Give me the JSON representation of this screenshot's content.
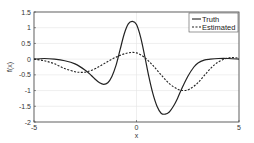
{
  "chart_data": {
    "type": "line",
    "title": "",
    "xlabel": "x",
    "ylabel": "f(x)",
    "xlim": [
      -5,
      5
    ],
    "ylim": [
      -2,
      1.5
    ],
    "xticks": [
      -5,
      0,
      5
    ],
    "xtick_labels": [
      "-5",
      "0",
      "5"
    ],
    "yticks": [
      -2,
      -1.5,
      -1,
      -0.5,
      0,
      0.5,
      1,
      1.5
    ],
    "ytick_labels": [
      "-2",
      "-1.5",
      "-1",
      "-0.5",
      "0",
      "0.5",
      "1",
      "1.5"
    ],
    "grid": true,
    "legend_position": "top-right",
    "series": [
      {
        "name": "Truth",
        "style": "solid",
        "color": "#222222",
        "x": [
          -5,
          -4.5,
          -4,
          -3.5,
          -3,
          -2.5,
          -2.2,
          -2,
          -1.8,
          -1.6,
          -1.4,
          -1.2,
          -1,
          -0.8,
          -0.6,
          -0.4,
          -0.2,
          0,
          0.2,
          0.4,
          0.6,
          0.8,
          1,
          1.2,
          1.4,
          1.6,
          1.8,
          2,
          2.2,
          2.5,
          2.8,
          3,
          3.3,
          3.6,
          4,
          4.5,
          5
        ],
        "y": [
          0.0,
          0.02,
          0.0,
          -0.05,
          -0.15,
          -0.35,
          -0.52,
          -0.65,
          -0.75,
          -0.8,
          -0.75,
          -0.55,
          -0.2,
          0.3,
          0.8,
          1.12,
          1.2,
          1.1,
          0.7,
          0.1,
          -0.55,
          -1.1,
          -1.5,
          -1.72,
          -1.75,
          -1.68,
          -1.5,
          -1.25,
          -0.95,
          -0.55,
          -0.25,
          -0.12,
          -0.03,
          0.0,
          0.02,
          0.02,
          0.0
        ]
      },
      {
        "name": "Estimated",
        "style": "dashed",
        "color": "#222222",
        "x": [
          -5,
          -4.5,
          -4,
          -3.5,
          -3,
          -2.7,
          -2.4,
          -2,
          -1.6,
          -1.2,
          -0.8,
          -0.4,
          0,
          0.4,
          0.8,
          1.2,
          1.6,
          2,
          2.3,
          2.6,
          3,
          3.4,
          3.8,
          4.2,
          4.6,
          5
        ],
        "y": [
          0.0,
          -0.05,
          -0.15,
          -0.3,
          -0.4,
          -0.42,
          -0.4,
          -0.3,
          -0.15,
          0.0,
          0.12,
          0.2,
          0.2,
          0.05,
          -0.2,
          -0.5,
          -0.78,
          -0.95,
          -1.0,
          -0.95,
          -0.75,
          -0.45,
          -0.18,
          -0.02,
          0.05,
          0.03
        ]
      }
    ]
  }
}
